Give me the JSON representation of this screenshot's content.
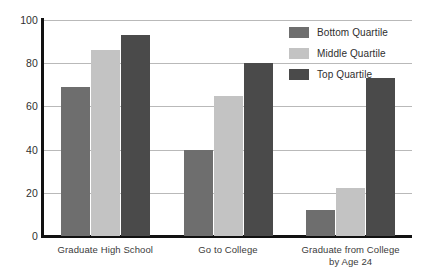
{
  "chart_data": {
    "type": "bar",
    "title": "",
    "xlabel": "",
    "ylabel": "",
    "categories": [
      "Graduate High School",
      "Go to College",
      "Graduate from College\nby Age 24"
    ],
    "category_lines": [
      [
        "Graduate High School"
      ],
      [
        "Go to College"
      ],
      [
        "Graduate from College",
        "by Age 24"
      ]
    ],
    "series": [
      {
        "name": "Bottom Quartile",
        "color": "#6e6e6e",
        "values": [
          69,
          40,
          12
        ]
      },
      {
        "name": "Middle Quartile",
        "color": "#c3c3c3",
        "values": [
          86,
          65,
          22
        ]
      },
      {
        "name": "Top Quartile",
        "color": "#4a4a4a",
        "values": [
          93,
          80,
          73
        ]
      }
    ],
    "ylim": [
      0,
      100
    ],
    "yticks": [
      0,
      20,
      40,
      60,
      80,
      100
    ],
    "ytick_labels": [
      "0",
      "20",
      "40",
      "60",
      "80",
      "100"
    ],
    "grid": true,
    "legend_position": "top-right"
  },
  "legend": {
    "entries": [
      {
        "label": "Bottom Quartile",
        "color": "#6e6e6e"
      },
      {
        "label": "Middle Quartile",
        "color": "#c3c3c3"
      },
      {
        "label": "Top Quartile",
        "color": "#4a4a4a"
      }
    ]
  },
  "axis_colors": {
    "axis_line": "#111111",
    "gridline": "#b9b9b9",
    "tick_text": "#2f2f2f"
  }
}
